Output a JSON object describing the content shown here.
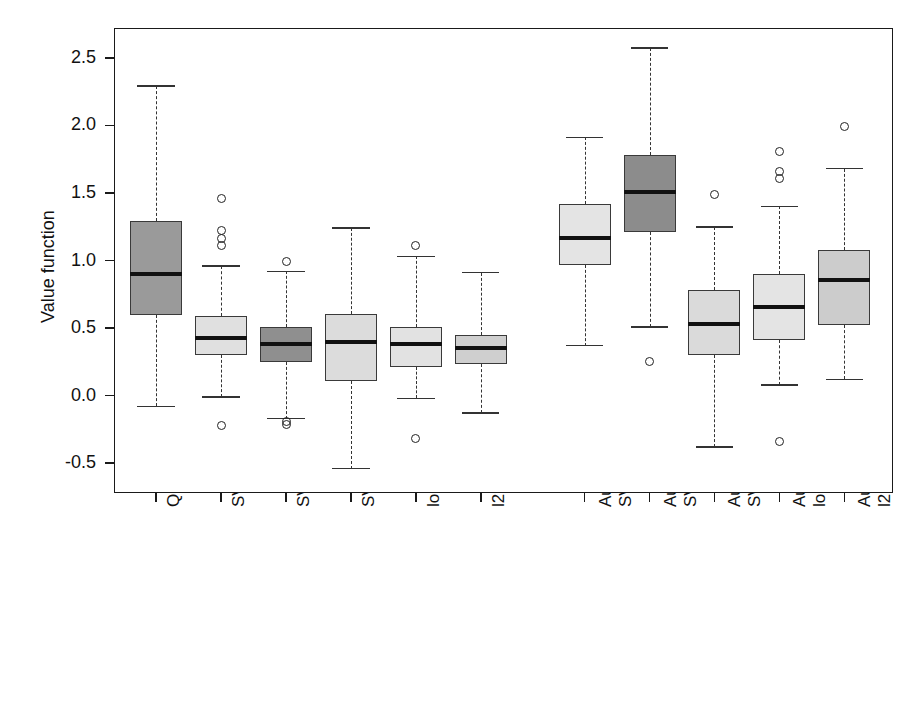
{
  "chart_data": {
    "type": "box",
    "title": "",
    "xlabel": "",
    "ylabel": "Value function",
    "ylim": [
      -0.72,
      2.72
    ],
    "yticks": [
      -0.5,
      0.0,
      0.5,
      1.0,
      1.5,
      2.0,
      2.5
    ],
    "ytick_labels": [
      "-0.5",
      "0.0",
      "0.5",
      "1.0",
      "1.5",
      "2.0",
      "2.5"
    ],
    "grid": false,
    "legend": "none",
    "categories": [
      "Qlearning + lasso",
      "SVM hinge + linear",
      "SVM hinge + rbf",
      "SVM ramp + linear",
      "logit.lasso",
      "l2.lasso",
      "Augment +\nSVM hinge + linear",
      "Augment +\nSVM hinge + rbf",
      "Augment +\nSVM ramp + linear",
      "Augment +\nlogit.lasso",
      "Augment +\nl2.lasso"
    ],
    "boxes": [
      {
        "name": "Qlearning + lasso",
        "x": 1,
        "whisker_low": -0.08,
        "q1": 0.6,
        "median": 0.9,
        "q3": 1.29,
        "whisker_high": 2.29,
        "outliers": [],
        "fill": "#9a9a9a"
      },
      {
        "name": "SVM hinge + linear",
        "x": 2,
        "whisker_low": -0.01,
        "q1": 0.3,
        "median": 0.43,
        "q3": 0.59,
        "whisker_high": 0.96,
        "outliers": [
          1.46,
          1.22,
          1.16,
          1.11,
          -0.22
        ],
        "fill": "#e0e0e0"
      },
      {
        "name": "SVM hinge + rbf",
        "x": 3,
        "whisker_low": -0.17,
        "q1": 0.25,
        "median": 0.385,
        "q3": 0.51,
        "whisker_high": 0.92,
        "outliers": [
          0.99,
          -0.19,
          -0.21
        ],
        "fill": "#8f8f8f"
      },
      {
        "name": "SVM ramp + linear",
        "x": 4,
        "whisker_low": -0.54,
        "q1": 0.11,
        "median": 0.4,
        "q3": 0.605,
        "whisker_high": 1.24,
        "outliers": [],
        "fill": "#dcdcdc"
      },
      {
        "name": "logit.lasso",
        "x": 5,
        "whisker_low": -0.02,
        "q1": 0.21,
        "median": 0.385,
        "q3": 0.51,
        "whisker_high": 1.03,
        "outliers": [
          1.11,
          -0.32
        ],
        "fill": "#e2e2e2"
      },
      {
        "name": "l2.lasso",
        "x": 6,
        "whisker_low": -0.13,
        "q1": 0.235,
        "median": 0.355,
        "q3": 0.45,
        "whisker_high": 0.91,
        "outliers": [],
        "fill": "#cfcfcf"
      },
      {
        "name": "Augment + SVM hinge + linear",
        "x": 7.6,
        "whisker_low": 0.37,
        "q1": 0.97,
        "median": 1.17,
        "q3": 1.42,
        "whisker_high": 1.91,
        "outliers": [],
        "fill": "#e4e4e4"
      },
      {
        "name": "Augment + SVM hinge + rbf",
        "x": 8.6,
        "whisker_low": 0.51,
        "q1": 1.21,
        "median": 1.51,
        "q3": 1.78,
        "whisker_high": 2.57,
        "outliers": [
          0.25
        ],
        "fill": "#8c8c8c"
      },
      {
        "name": "Augment + SVM ramp + linear",
        "x": 9.6,
        "whisker_low": -0.38,
        "q1": 0.3,
        "median": 0.53,
        "q3": 0.78,
        "whisker_high": 1.25,
        "outliers": [
          1.49
        ],
        "fill": "#dadada"
      },
      {
        "name": "Augment + logit.lasso",
        "x": 10.6,
        "whisker_low": 0.08,
        "q1": 0.41,
        "median": 0.655,
        "q3": 0.9,
        "whisker_high": 1.4,
        "outliers": [
          1.81,
          1.66,
          1.61,
          -0.34
        ],
        "fill": "#e4e4e4"
      },
      {
        "name": "Augment + l2.lasso",
        "x": 11.6,
        "whisker_low": 0.12,
        "q1": 0.52,
        "median": 0.855,
        "q3": 1.08,
        "whisker_high": 1.68,
        "outliers": [
          1.99
        ],
        "fill": "#cccccc"
      }
    ]
  }
}
